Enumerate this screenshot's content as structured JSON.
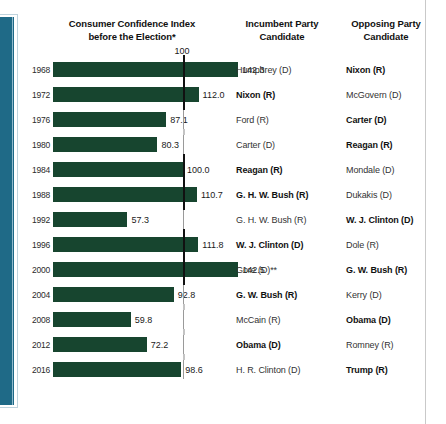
{
  "header": {
    "chart_title_line1": "Consumer Confidence Index",
    "chart_title_line2": "before the Election*",
    "incumbent_col": "Incumbent Party",
    "incumbent_col_line2": "Candidate",
    "opposing_col": "Opposing Party",
    "opposing_col_line2": "Candidate"
  },
  "axis": {
    "tick_label": "100"
  },
  "colors": {
    "bar": "#17452f",
    "spine": "#1c6583",
    "reference_line": "#111111",
    "right_rule": "#c9c9c9"
  },
  "chart_data": {
    "type": "bar",
    "title": "Consumer Confidence Index before the Election*",
    "xlabel": "",
    "ylabel": "",
    "orientation": "horizontal",
    "reference_line": 100,
    "grid": false,
    "xlim": [
      0,
      150
    ],
    "categories": [
      "1968",
      "1972",
      "1976",
      "1980",
      "1984",
      "1988",
      "1992",
      "1996",
      "2000",
      "2004",
      "2008",
      "2012",
      "2016"
    ],
    "values": [
      142.3,
      112.0,
      87.1,
      80.3,
      100.0,
      110.7,
      57.3,
      111.8,
      142.5,
      92.8,
      59.8,
      72.2,
      98.6
    ],
    "value_labels": [
      "142.3",
      "112.0",
      "87.1",
      "80.3",
      "100.0",
      "110.7",
      "57.3",
      "111.8",
      "142.5",
      "92.8",
      "59.8",
      "72.2",
      "98.6"
    ],
    "rows": [
      {
        "year": "1968",
        "value": 142.3,
        "value_label": "142.3",
        "incumbent": "Humphrey (D)",
        "incumbent_won": false,
        "opposing": "Nixon (R)",
        "opposing_won": true
      },
      {
        "year": "1972",
        "value": 112.0,
        "value_label": "112.0",
        "incumbent": "Nixon (R)",
        "incumbent_won": true,
        "opposing": "McGovern (D)",
        "opposing_won": false
      },
      {
        "year": "1976",
        "value": 87.1,
        "value_label": "87.1",
        "incumbent": "Ford (R)",
        "incumbent_won": false,
        "opposing": "Carter (D)",
        "opposing_won": true
      },
      {
        "year": "1980",
        "value": 80.3,
        "value_label": "80.3",
        "incumbent": "Carter (D)",
        "incumbent_won": false,
        "opposing": "Reagan (R)",
        "opposing_won": true
      },
      {
        "year": "1984",
        "value": 100.0,
        "value_label": "100.0",
        "incumbent": "Reagan (R)",
        "incumbent_won": true,
        "opposing": "Mondale (D)",
        "opposing_won": false
      },
      {
        "year": "1988",
        "value": 110.7,
        "value_label": "110.7",
        "incumbent": "G. H. W. Bush (R)",
        "incumbent_won": true,
        "opposing": "Dukakis (D)",
        "opposing_won": false
      },
      {
        "year": "1992",
        "value": 57.3,
        "value_label": "57.3",
        "incumbent": "G. H. W. Bush (R)",
        "incumbent_won": false,
        "opposing": "W. J. Clinton (D)",
        "opposing_won": true
      },
      {
        "year": "1996",
        "value": 111.8,
        "value_label": "111.8",
        "incumbent": "W. J. Clinton (D)",
        "incumbent_won": true,
        "opposing": "Dole (R)",
        "opposing_won": false
      },
      {
        "year": "2000",
        "value": 142.5,
        "value_label": "142.5",
        "incumbent": "Gore (D)**",
        "incumbent_won": false,
        "opposing": "G. W. Bush (R)",
        "opposing_won": true
      },
      {
        "year": "2004",
        "value": 92.8,
        "value_label": "92.8",
        "incumbent": "G. W. Bush (R)",
        "incumbent_won": true,
        "opposing": "Kerry (D)",
        "opposing_won": false
      },
      {
        "year": "2008",
        "value": 59.8,
        "value_label": "59.8",
        "incumbent": "McCain (R)",
        "incumbent_won": false,
        "opposing": "Obama (D)",
        "opposing_won": true
      },
      {
        "year": "2012",
        "value": 72.2,
        "value_label": "72.2",
        "incumbent": "Obama (D)",
        "incumbent_won": true,
        "opposing": "Romney (R)",
        "opposing_won": false
      },
      {
        "year": "2016",
        "value": 98.6,
        "value_label": "98.6",
        "incumbent": "H. R. Clinton (D)",
        "incumbent_won": false,
        "opposing": "Trump (R)",
        "opposing_won": true
      }
    ]
  }
}
